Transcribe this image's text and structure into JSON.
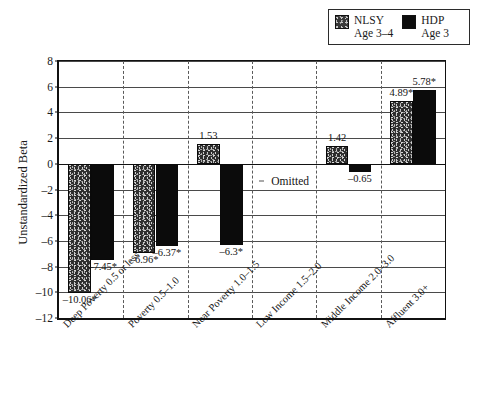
{
  "chart_data": {
    "type": "bar",
    "title": "",
    "xlabel": "",
    "ylabel": "Unstandardized Beta",
    "ylim": [
      -12,
      8
    ],
    "yticks": [
      8,
      6,
      4,
      2,
      0,
      -2,
      -4,
      -6,
      -8,
      -10,
      -12
    ],
    "ytick_labels": [
      "8",
      "6",
      "4",
      "2",
      "0",
      "–2",
      "–4",
      "–6",
      "–8",
      "–10",
      "–12"
    ],
    "grid": true,
    "legend_position": "top-right",
    "categories": [
      "Deep Poverty 0.5 or less",
      "Poverty 0.5–1.0",
      "Near Poverty 1.0–1.5",
      "Low Income 1.5–2.0",
      "Middle Income 2.0–3.0",
      "Affluent 3.0+"
    ],
    "series": [
      {
        "name": "NLSY",
        "sublabel": "Age 3–4",
        "color": "#2e2e2e",
        "pattern": "speckled",
        "values": [
          -10.06,
          -6.96,
          1.53,
          null,
          1.42,
          4.89
        ],
        "labels": [
          "–10.06*",
          "–6.96*",
          "1.53",
          "Omitted",
          "1.42",
          "4.89*"
        ]
      },
      {
        "name": "HDP",
        "sublabel": "Age 3",
        "color": "#0b0b0b",
        "pattern": "solid",
        "values": [
          -7.45,
          -6.37,
          -6.3,
          null,
          -0.65,
          5.78
        ],
        "labels": [
          "–7.45*",
          "–6.37*",
          "–6.3*",
          "Omitted",
          "–0.65",
          "5.78*"
        ]
      }
    ],
    "omitted_note": "Omitted",
    "omitted_category": "Low Income 1.5–2.0",
    "significance_marker": "*"
  },
  "legend": {
    "entries": [
      {
        "name": "NLSY",
        "sublabel": "Age 3–4",
        "swatch": "nlsy-swatch"
      },
      {
        "name": "HDP",
        "sublabel": "Age 3",
        "swatch": "hdp-swatch"
      }
    ]
  },
  "axis": {
    "y_title": "Unstandardized Beta"
  }
}
